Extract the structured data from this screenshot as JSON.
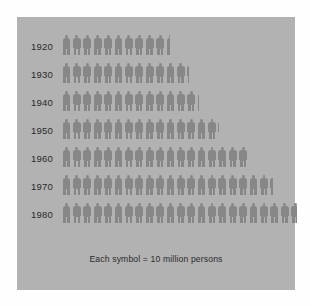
{
  "chart_data": {
    "type": "bar",
    "subtype": "pictogram",
    "title": "",
    "subtitle": "",
    "xlabel": "",
    "ylabel": "",
    "caption": "Each symbol = 10 million persons",
    "symbol_value": 10,
    "symbol_unit": "million persons",
    "symbol_name": "person-figure",
    "grid": false,
    "legend_position": "bottom",
    "categories": [
      "1920",
      "1930",
      "1940",
      "1950",
      "1960",
      "1970",
      "1980"
    ],
    "values": [
      105,
      123,
      132,
      151,
      179,
      203,
      227
    ],
    "symbol_counts": [
      10.5,
      12.3,
      13.2,
      15.1,
      17.9,
      20.3,
      22.7
    ],
    "rows": [
      {
        "label": "1920",
        "value": 105,
        "symbols": 10.5
      },
      {
        "label": "1930",
        "value": 123,
        "symbols": 12.3
      },
      {
        "label": "1940",
        "value": 132,
        "symbols": 13.2
      },
      {
        "label": "1950",
        "value": 151,
        "symbols": 15.1
      },
      {
        "label": "1960",
        "value": 179,
        "symbols": 17.9
      },
      {
        "label": "1970",
        "value": 203,
        "symbols": 20.3
      },
      {
        "label": "1980",
        "value": 227,
        "symbols": 22.7
      }
    ],
    "colors": {
      "panel_background": "#b2b2b2",
      "symbol": "#878787",
      "text": "#2a2a2a",
      "page_background": "#fefefe"
    }
  },
  "caption": {
    "text": "Each symbol = 10 million persons"
  }
}
